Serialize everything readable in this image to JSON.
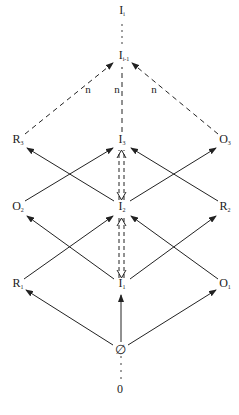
{
  "diagram": {
    "nodes": {
      "I_i": {
        "base": "I",
        "sub": "i",
        "x": 122,
        "y": 12
      },
      "I_im1": {
        "base": "I",
        "sub": "i-1",
        "x": 122,
        "y": 57
      },
      "R_3": {
        "base": "R",
        "sub": "3",
        "x": 17,
        "y": 141
      },
      "I_3": {
        "base": "I",
        "sub": "3",
        "x": 122,
        "y": 141
      },
      "O_3": {
        "base": "O",
        "sub": "3",
        "x": 225,
        "y": 141
      },
      "O_2": {
        "base": "O",
        "sub": "2",
        "x": 17,
        "y": 208
      },
      "I_2": {
        "base": "I",
        "sub": "2",
        "x": 122,
        "y": 208
      },
      "R_2": {
        "base": "R",
        "sub": "2",
        "x": 225,
        "y": 208
      },
      "R_1": {
        "base": "R",
        "sub": "1",
        "x": 17,
        "y": 285
      },
      "I_1": {
        "base": "I",
        "sub": "1",
        "x": 122,
        "y": 285
      },
      "O_1": {
        "base": "O",
        "sub": "1",
        "x": 225,
        "y": 285
      },
      "empty": {
        "base": "∅",
        "sub": "",
        "x": 120,
        "y": 350
      },
      "zero": {
        "base": "0",
        "sub": "",
        "x": 120,
        "y": 389
      }
    },
    "edge_labels": [
      "n",
      "n",
      "n"
    ],
    "edges": [
      {
        "from": "empty",
        "to": "R_1",
        "style": "solid-arrow"
      },
      {
        "from": "empty",
        "to": "I_1",
        "style": "solid-arrow"
      },
      {
        "from": "empty",
        "to": "O_1",
        "style": "solid-arrow"
      },
      {
        "from": "R_1",
        "to": "I_2",
        "style": "solid-arrow"
      },
      {
        "from": "I_1",
        "to": "O_2",
        "style": "solid-arrow"
      },
      {
        "from": "I_1",
        "to": "R_2",
        "style": "solid-arrow"
      },
      {
        "from": "O_1",
        "to": "I_2",
        "style": "solid-arrow"
      },
      {
        "from": "O_2",
        "to": "I_3",
        "style": "solid-arrow"
      },
      {
        "from": "I_2",
        "to": "R_3",
        "style": "solid-arrow"
      },
      {
        "from": "I_2",
        "to": "O_3",
        "style": "solid-arrow"
      },
      {
        "from": "R_2",
        "to": "I_3",
        "style": "solid-arrow"
      },
      {
        "from": "I_1",
        "to": "I_2",
        "style": "dashed-double-arrow"
      },
      {
        "from": "I_2",
        "to": "I_3",
        "style": "dashed-double-arrow"
      },
      {
        "from": "R_3",
        "to": "I_im1",
        "style": "dashed-arrow",
        "label": "n"
      },
      {
        "from": "I_3",
        "to": "I_im1",
        "style": "dashed",
        "label": "n"
      },
      {
        "from": "O_3",
        "to": "I_im1",
        "style": "dashed-arrow",
        "label": "n"
      },
      {
        "from": "I_im1",
        "to": "I_i",
        "style": "dotted"
      },
      {
        "from": "zero",
        "to": "empty",
        "style": "dotted"
      }
    ]
  }
}
